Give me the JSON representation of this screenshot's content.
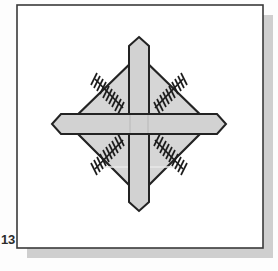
{
  "figure": {
    "number_label": "13",
    "caption": "",
    "frame": {
      "x": 17,
      "y": 5,
      "width": 246,
      "height": 243,
      "fill": "#ffffff",
      "border_color": "#3a3a3a",
      "border_width": 1.6,
      "shadow_color": "#cfcfcf",
      "shadow_offset_x": 10,
      "shadow_offset_y": 10
    },
    "background_color": "#fdfdfd",
    "ink_color": "#232323",
    "fill_light": "#d6d6d6",
    "fill_bar": "#d2d2d2",
    "diagram": {
      "name": "hatched-diamond-with-cross",
      "center_x": 139,
      "center_y": 124,
      "diamond": {
        "name": "diamond-plate",
        "top_x": 139,
        "top_y": 55,
        "right_x": 210,
        "right_y": 124,
        "bottom_x": 139,
        "bottom_y": 195,
        "left_x": 68,
        "left_y": 124,
        "fill": "#d6d6d6",
        "stroke": "#232323",
        "stroke_width": 2.2
      },
      "vertical_bar": {
        "name": "vertical-bar",
        "x_left": 129,
        "x_right": 149,
        "y_top": 37,
        "y_bottom": 211,
        "tip_length": 9,
        "fill": "#d2d2d2",
        "stroke": "#232323",
        "stroke_width": 2.0
      },
      "horizontal_bar": {
        "name": "horizontal-bar",
        "y_top": 114,
        "y_bottom": 134,
        "x_left": 52,
        "x_right": 226,
        "tip_length": 9,
        "fill": "#d2d2d2",
        "stroke": "#232323",
        "stroke_width": 2.0
      },
      "hatch_marks": {
        "name": "quadrant-hatch-lines",
        "count": 4,
        "ticks_per_line": 9,
        "tick_length": 11,
        "stroke": "#1c1c1c",
        "stroke_width": 1.7,
        "quadrants": [
          {
            "name": "hatch-top-left",
            "x1": 96,
            "y1": 80,
            "x2": 122,
            "y2": 107
          },
          {
            "name": "hatch-top-right",
            "x1": 182,
            "y1": 80,
            "x2": 156,
            "y2": 107
          },
          {
            "name": "hatch-bottom-left",
            "x1": 96,
            "y1": 168,
            "x2": 122,
            "y2": 141
          },
          {
            "name": "hatch-bottom-right",
            "x1": 182,
            "y1": 168,
            "x2": 156,
            "y2": 141
          }
        ]
      }
    }
  }
}
